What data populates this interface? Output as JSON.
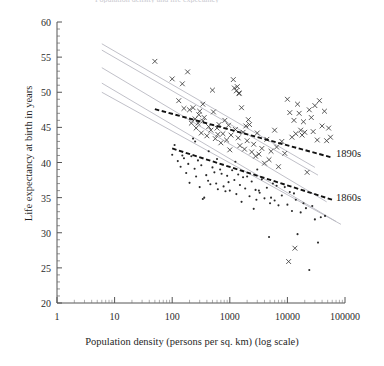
{
  "figure": {
    "clipped_header_text": "Population density and life expectancy",
    "background_color": "#ffffff"
  },
  "axes": {
    "y_title": "Life expectancy at birth in years",
    "x_title": "Population density (persons per sq. km) (log scale)",
    "y_ticks": [
      20,
      25,
      30,
      35,
      40,
      45,
      50,
      55,
      60
    ],
    "x_ticks": [
      "1",
      "10",
      "100",
      "1000",
      "10000",
      "100000"
    ],
    "x_tick_values": [
      1,
      10,
      100,
      1000,
      10000,
      100000
    ]
  },
  "annotations": [
    {
      "name": "label-1890s",
      "text": "1890s",
      "x_px": 336,
      "y_px": 155
    },
    {
      "name": "label-1860s",
      "text": "1860s",
      "x_px": 336,
      "y_px": 199
    }
  ],
  "chart_data": {
    "type": "scatter",
    "title": "",
    "xlabel": "Population density (persons per sq. km) (log scale)",
    "ylabel": "Life expectancy at birth in years",
    "xscale": "log",
    "xlim": [
      1,
      100000
    ],
    "ylim": [
      20,
      60
    ],
    "grid": false,
    "legend_position": "inline-right",
    "colors": {
      "marker_1890s": "#3a3a3a",
      "marker_1860s": "#2a2a2a",
      "fit_line": "#111111",
      "reference_lines": "#b9b9c2"
    },
    "series": [
      {
        "name": "1890s",
        "marker": "x",
        "points": [
          [
            50,
            54.4
          ],
          [
            100,
            51.9
          ],
          [
            130,
            48.8
          ],
          [
            150,
            51.2
          ],
          [
            160,
            47.7
          ],
          [
            185,
            52.9
          ],
          [
            200,
            47.5
          ],
          [
            215,
            45.6
          ],
          [
            230,
            47.8
          ],
          [
            250,
            46.2
          ],
          [
            260,
            44.9
          ],
          [
            280,
            45.6
          ],
          [
            300,
            47.3
          ],
          [
            320,
            44.2
          ],
          [
            340,
            45.9
          ],
          [
            360,
            46.4
          ],
          [
            400,
            43.8
          ],
          [
            430,
            45.1
          ],
          [
            470,
            44.6
          ],
          [
            500,
            50.3
          ],
          [
            520,
            47.2
          ],
          [
            560,
            43.4
          ],
          [
            600,
            44.9
          ],
          [
            650,
            45.4
          ],
          [
            700,
            42.8
          ],
          [
            760,
            44.1
          ],
          [
            820,
            46.0
          ],
          [
            880,
            43.2
          ],
          [
            950,
            45.3
          ],
          [
            1000,
            41.8
          ],
          [
            1050,
            43.9
          ],
          [
            1150,
            51.8
          ],
          [
            1200,
            50.6
          ],
          [
            1250,
            44.7
          ],
          [
            1300,
            50.2
          ],
          [
            1350,
            50.8
          ],
          [
            1400,
            43.5
          ],
          [
            1450,
            49.8
          ],
          [
            1500,
            42.4
          ],
          [
            1600,
            47.8
          ],
          [
            1700,
            44.3
          ],
          [
            1800,
            41.9
          ],
          [
            1900,
            45.2
          ],
          [
            2000,
            43.1
          ],
          [
            2200,
            45.4
          ],
          [
            2400,
            41.5
          ],
          [
            2600,
            42.6
          ],
          [
            2800,
            40.9
          ],
          [
            3000,
            44.2
          ],
          [
            3200,
            41.2
          ],
          [
            3600,
            42.0
          ],
          [
            4000,
            39.9
          ],
          [
            4400,
            43.3
          ],
          [
            4800,
            40.4
          ],
          [
            5200,
            41.6
          ],
          [
            6000,
            44.6
          ],
          [
            6500,
            42.2
          ],
          [
            7000,
            39.4
          ],
          [
            8000,
            43.0
          ],
          [
            9000,
            41.3
          ],
          [
            10000,
            49.0
          ],
          [
            11000,
            47.1
          ],
          [
            12000,
            43.6
          ],
          [
            13000,
            46.0
          ],
          [
            14000,
            44.1
          ],
          [
            15000,
            48.3
          ],
          [
            16000,
            47.0
          ],
          [
            17000,
            44.6
          ],
          [
            18000,
            43.9
          ],
          [
            19000,
            45.8
          ],
          [
            20000,
            44.3
          ],
          [
            22000,
            38.6
          ],
          [
            24000,
            47.5
          ],
          [
            26000,
            46.4
          ],
          [
            28000,
            44.4
          ],
          [
            30000,
            48.1
          ],
          [
            33000,
            43.2
          ],
          [
            36000,
            48.8
          ],
          [
            40000,
            45.2
          ],
          [
            44000,
            47.3
          ],
          [
            48000,
            43.1
          ],
          [
            52000,
            44.9
          ],
          [
            56000,
            43.6
          ],
          [
            13500,
            27.8
          ],
          [
            10500,
            25.9
          ],
          [
            1450,
            49.9
          ],
          [
            620,
            44.0
          ],
          [
            340,
            48.3
          ],
          [
            290,
            46.8
          ],
          [
            2100,
            46.1
          ]
        ]
      },
      {
        "name": "1860s",
        "marker": "dot",
        "points": [
          [
            100,
            41.1
          ],
          [
            110,
            42.5
          ],
          [
            125,
            40.2
          ],
          [
            140,
            39.4
          ],
          [
            150,
            41.0
          ],
          [
            160,
            40.6
          ],
          [
            175,
            38.5
          ],
          [
            190,
            39.8
          ],
          [
            200,
            37.1
          ],
          [
            215,
            40.9
          ],
          [
            230,
            43.4
          ],
          [
            245,
            39.1
          ],
          [
            260,
            38.0
          ],
          [
            280,
            40.3
          ],
          [
            300,
            36.5
          ],
          [
            320,
            39.6
          ],
          [
            340,
            34.8
          ],
          [
            360,
            35.0
          ],
          [
            390,
            38.2
          ],
          [
            420,
            37.4
          ],
          [
            460,
            36.9
          ],
          [
            500,
            39.3
          ],
          [
            540,
            38.6
          ],
          [
            580,
            37.0
          ],
          [
            620,
            36.2
          ],
          [
            680,
            39.0
          ],
          [
            720,
            38.4
          ],
          [
            780,
            36.6
          ],
          [
            840,
            35.9
          ],
          [
            900,
            38.1
          ],
          [
            950,
            37.2
          ],
          [
            1000,
            36.0
          ],
          [
            1100,
            38.9
          ],
          [
            1200,
            37.5
          ],
          [
            1300,
            35.5
          ],
          [
            1400,
            38.3
          ],
          [
            1500,
            36.8
          ],
          [
            1600,
            34.4
          ],
          [
            1700,
            37.9
          ],
          [
            1850,
            36.3
          ],
          [
            2000,
            38.0
          ],
          [
            2200,
            35.2
          ],
          [
            2400,
            37.3
          ],
          [
            2600,
            33.4
          ],
          [
            2800,
            36.1
          ],
          [
            3000,
            39.0
          ],
          [
            3300,
            35.7
          ],
          [
            3600,
            37.6
          ],
          [
            4000,
            34.9
          ],
          [
            4400,
            36.4
          ],
          [
            4800,
            29.4
          ],
          [
            5200,
            35.0
          ],
          [
            5600,
            37.0
          ],
          [
            6000,
            34.6
          ],
          [
            6500,
            36.7
          ],
          [
            7000,
            33.9
          ],
          [
            8000,
            35.3
          ],
          [
            9000,
            36.5
          ],
          [
            10000,
            34.0
          ],
          [
            11000,
            35.8
          ],
          [
            12000,
            33.1
          ],
          [
            13000,
            35.6
          ],
          [
            14000,
            34.7
          ],
          [
            15000,
            29.8
          ],
          [
            17000,
            32.9
          ],
          [
            19000,
            34.2
          ],
          [
            21000,
            33.5
          ],
          [
            24000,
            24.7
          ],
          [
            27000,
            33.8
          ],
          [
            30000,
            31.9
          ],
          [
            34000,
            28.6
          ],
          [
            38000,
            32.2
          ],
          [
            45000,
            32.4
          ],
          [
            600,
            40.5
          ],
          [
            430,
            41.6
          ],
          [
            250,
            43.0
          ],
          [
            1250,
            40.1
          ],
          [
            3200,
            36.0
          ],
          [
            5000,
            34.2
          ],
          [
            2900,
            34.7
          ]
        ]
      }
    ],
    "fit_lines": [
      {
        "name": "1890s-fit",
        "style": "dashed",
        "color": "#111111",
        "x_start": 50,
        "y_start": 47.6,
        "x_end": 60000,
        "y_end": 40.7
      },
      {
        "name": "1860s-fit",
        "style": "dashed",
        "color": "#111111",
        "x_start": 100,
        "y_start": 42.0,
        "x_end": 60000,
        "y_end": 34.7
      }
    ],
    "reference_lines": [
      {
        "name": "reference-line-1",
        "style": "solid",
        "color": "#b9b9c2",
        "x_start": 6,
        "y_start": 56.9,
        "x_end": 30000,
        "y_end": 39.3
      },
      {
        "name": "reference-line-2",
        "style": "solid",
        "color": "#b9b9c2",
        "x_start": 6,
        "y_start": 56.0,
        "x_end": 34000,
        "y_end": 38.2
      },
      {
        "name": "reference-line-3",
        "style": "solid",
        "color": "#b9b9c2",
        "x_start": 6,
        "y_start": 53.5,
        "x_end": 48000,
        "y_end": 34.4
      },
      {
        "name": "reference-line-4",
        "style": "solid",
        "color": "#b9b9c2",
        "x_start": 6,
        "y_start": 51.3,
        "x_end": 70000,
        "y_end": 31.6
      },
      {
        "name": "reference-line-5",
        "style": "solid",
        "color": "#b9b9c2",
        "x_start": 6,
        "y_start": 50.0,
        "x_end": 85000,
        "y_end": 31.2
      }
    ]
  }
}
